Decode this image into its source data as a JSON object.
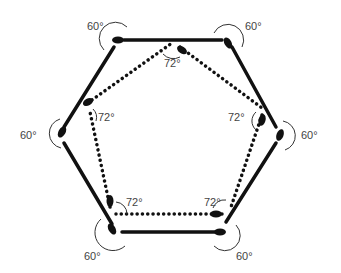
{
  "diagram": {
    "type": "geometric-figure",
    "colors": {
      "stroke": "#111111",
      "label": "#444444",
      "background": "#ffffff"
    },
    "hexagon": {
      "style": "solid",
      "vertices": [
        [
          118,
          40
        ],
        [
          228,
          40
        ],
        [
          280,
          135
        ],
        [
          222,
          228
        ],
        [
          110,
          228
        ],
        [
          60,
          135
        ]
      ],
      "angle_label": "60°",
      "labels": [
        {
          "text": "60°",
          "x": 87,
          "y": 20
        },
        {
          "text": "60°",
          "x": 245,
          "y": 20
        },
        {
          "text": "60°",
          "x": 301,
          "y": 129
        },
        {
          "text": "60°",
          "x": 236,
          "y": 250
        },
        {
          "text": "60°",
          "x": 84,
          "y": 250
        },
        {
          "text": "60°",
          "x": 20,
          "y": 129
        }
      ]
    },
    "pentagon": {
      "style": "dotted",
      "vertices": [
        [
          180,
          47
        ],
        [
          262,
          108
        ],
        [
          230,
          212
        ],
        [
          110,
          213
        ],
        [
          88,
          103
        ]
      ],
      "angle_label": "72°",
      "labels": [
        {
          "text": "72°",
          "x": 164,
          "y": 57
        },
        {
          "text": "72°",
          "x": 228,
          "y": 111
        },
        {
          "text": "72°",
          "x": 204,
          "y": 196
        },
        {
          "text": "72°",
          "x": 126,
          "y": 196
        },
        {
          "text": "72°",
          "x": 98,
          "y": 111
        }
      ]
    }
  }
}
